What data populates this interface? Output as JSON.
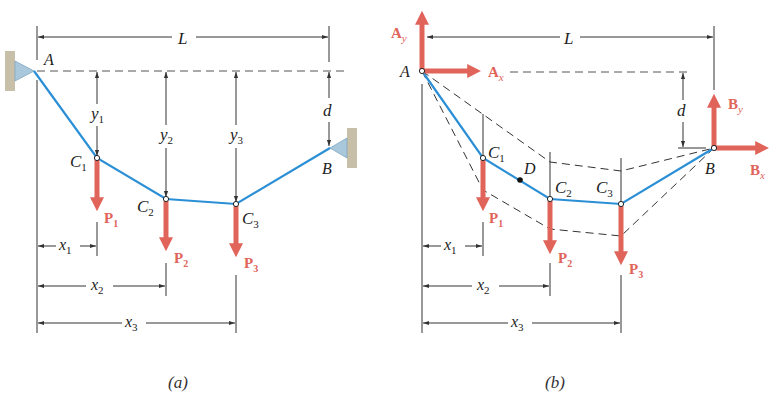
{
  "figure": {
    "panels": [
      {
        "id": "a",
        "caption": "(a)",
        "labels": {
          "L": "L",
          "A": "A",
          "B": "B",
          "d": "d",
          "C1": "C",
          "C1_sub": "1",
          "C2": "C",
          "C2_sub": "2",
          "C3": "C",
          "C3_sub": "3",
          "y1": "y",
          "y1_sub": "1",
          "y2": "y",
          "y2_sub": "2",
          "y3": "y",
          "y3_sub": "3",
          "x1": "x",
          "x1_sub": "1",
          "x2": "x",
          "x2_sub": "2",
          "x3": "x",
          "x3_sub": "3",
          "P1": "P",
          "P1_sub": "1",
          "P2": "P",
          "P2_sub": "2",
          "P3": "P",
          "P3_sub": "3"
        }
      },
      {
        "id": "b",
        "caption": "(b)",
        "labels": {
          "L": "L",
          "A": "A",
          "B": "B",
          "d": "d",
          "D": "D",
          "Ay": "A",
          "Ay_sub": "y",
          "Ax": "A",
          "Ax_sub": "x",
          "By": "B",
          "By_sub": "y",
          "Bx": "B",
          "Bx_sub": "x",
          "C1": "C",
          "C1_sub": "1",
          "C2": "C",
          "C2_sub": "2",
          "C3": "C",
          "C3_sub": "3",
          "x1": "x",
          "x1_sub": "1",
          "x2": "x",
          "x2_sub": "2",
          "x3": "x",
          "x3_sub": "3",
          "P1": "P",
          "P1_sub": "1",
          "P2": "P",
          "P2_sub": "2",
          "P3": "P",
          "P3_sub": "3"
        }
      }
    ],
    "colors": {
      "cable": "#2b8fd6",
      "force": "#e0645a",
      "dim": "#333333",
      "support": "#a9c8dc",
      "wall": "#c8bfa8"
    }
  }
}
